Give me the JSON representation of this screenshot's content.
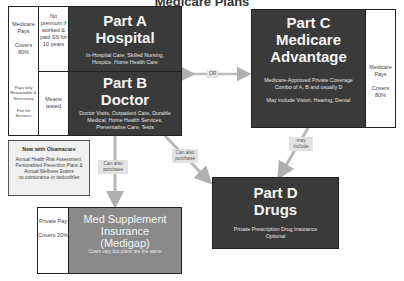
{
  "title": "Medicare Plans",
  "left_column": {
    "medicare_pays": "Medicare Pays",
    "covers": "Covers 80%",
    "pays_only": "Pays only Reasonable & Necessary",
    "fee_for_services": "Fee for Services"
  },
  "part_a": {
    "condition": "No premium if worked & paid SS for 10 years",
    "title": "Part A",
    "subtitle": "Hospital",
    "description": "In-Hospital Care, Skilled Nursing, Hospice, Home Health Care"
  },
  "part_b": {
    "condition": "Means tested",
    "title": "Part B",
    "subtitle": "Doctor",
    "description": "Doctor Visits, Outpatient Care, Durable Medical, Home Health Services, Preventative Care, Tests"
  },
  "part_c": {
    "title": "Part C",
    "subtitle1": "Medicare",
    "subtitle2": "Advantage",
    "description1": "Medicare-Approved Private Coverage",
    "description2": "Combo of A, B and usually D",
    "description3": "May include Vision, Hearing, Dental",
    "side_pays": "Medicare Pays",
    "side_covers": "Covers 80%"
  },
  "part_d": {
    "title": "Part D",
    "subtitle": "Drugs",
    "description1": "Private Prescription Drug Insurance",
    "description2": "Optional"
  },
  "obamacare": {
    "heading": "New with Obamacare",
    "body": "Annual Health Risk Assessment, Personalized Prevention Plans & Annual Wellness Exams",
    "note": "no coinsurance or deductibles"
  },
  "medigap": {
    "side_pays": "Private Pay",
    "side_covers": "Covers 20%",
    "title1": "Med Supplement",
    "title2": "Insurance",
    "title3": "(Medigap)",
    "description": "Costs vary but plans are the same"
  },
  "connectors": {
    "or": "OR",
    "can_also_purchase_medigap": "Can also purchase",
    "can_also_purchase_d": "Can also purchase",
    "may_include": "may include"
  },
  "colors": {
    "dark_box": "#3a3a3a",
    "medigap_box": "#8a8a8a",
    "arrow": "#b8b8b8"
  }
}
